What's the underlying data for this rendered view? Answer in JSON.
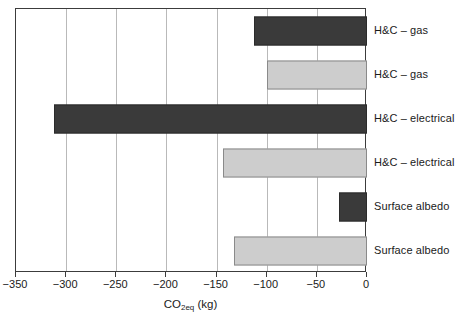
{
  "chart_data": {
    "type": "bar",
    "orientation": "horizontal",
    "title": "",
    "xlabel": "CO2eq (kg)",
    "xlabel_base": "CO",
    "xlabel_sub": "2eq",
    "xlabel_unit": " (kg)",
    "ylabel": "",
    "xlim": [
      -350,
      0
    ],
    "xticks": [
      -350,
      -300,
      -250,
      -200,
      -150,
      -100,
      -50,
      0
    ],
    "xtick_labels": [
      "−350",
      "−300",
      "−250",
      "−200",
      "−150",
      "−100",
      "−50",
      "0"
    ],
    "gridlines": [
      -300,
      -250,
      -200,
      -150,
      -100,
      -50
    ],
    "grid": true,
    "legend": "none",
    "categories": [
      "H&C – gas",
      "H&C – gas",
      "H&C – electrical",
      "H&C – electrical",
      "Surface albedo",
      "Surface albedo"
    ],
    "values": [
      -113,
      -100,
      -312,
      -144,
      -28,
      -133
    ],
    "bar_styles": [
      "dark",
      "light",
      "dark",
      "light",
      "dark",
      "light"
    ],
    "colors": {
      "dark_fill": "#3a3a3a",
      "dark_edge": "#2b2b2b",
      "light_fill": "#cdcdcd",
      "light_edge": "#8a8a8a",
      "gridline": "#b9b9b9",
      "axis": "#3c3c3c",
      "text": "#1a1a1a",
      "background": "#ffffff"
    },
    "bars": [
      {
        "label": "H&C – gas",
        "value": -113,
        "style": "dark"
      },
      {
        "label": "H&C – gas",
        "value": -100,
        "style": "light"
      },
      {
        "label": "H&C – electrical",
        "value": -312,
        "style": "dark"
      },
      {
        "label": "H&C – electrical",
        "value": -144,
        "style": "light"
      },
      {
        "label": "Surface albedo",
        "value": -28,
        "style": "dark"
      },
      {
        "label": "Surface albedo",
        "value": -133,
        "style": "light"
      }
    ]
  }
}
